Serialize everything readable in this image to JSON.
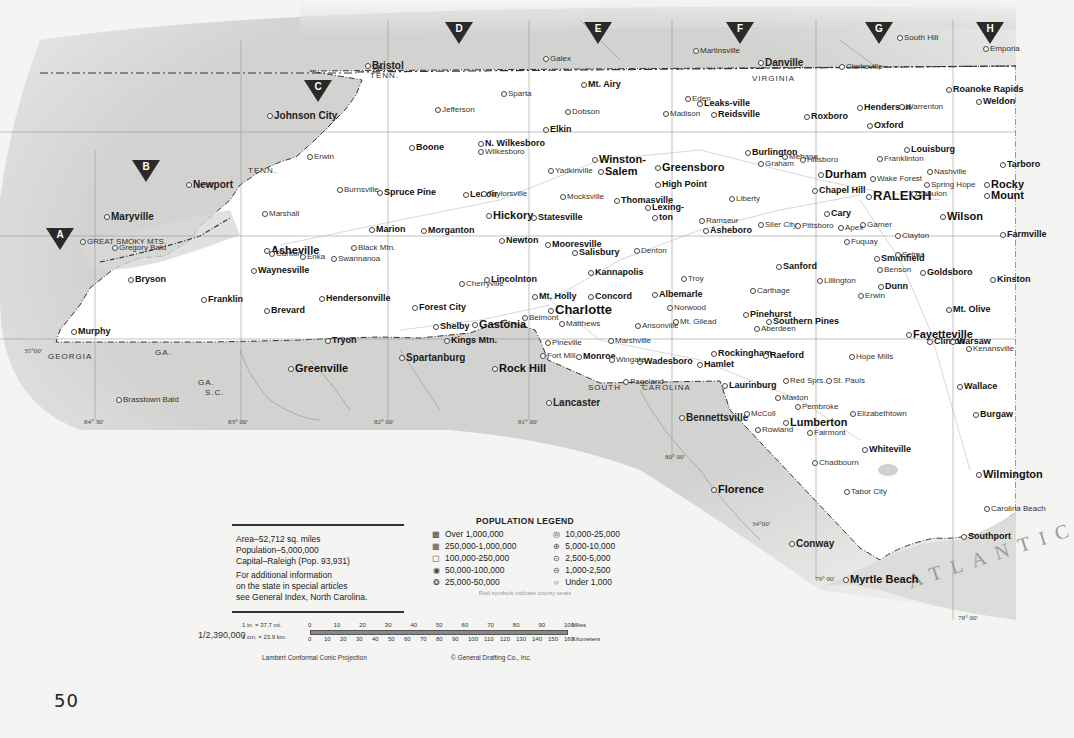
{
  "page": {
    "number": "50",
    "state_name": "North Carolina"
  },
  "grid_markers": [
    {
      "label": "A",
      "x": 60,
      "y": 228
    },
    {
      "label": "B",
      "x": 146,
      "y": 160
    },
    {
      "label": "C",
      "x": 318,
      "y": 80
    },
    {
      "label": "D",
      "x": 459,
      "y": 22
    },
    {
      "label": "E",
      "x": 598,
      "y": 22
    },
    {
      "label": "F",
      "x": 740,
      "y": 22
    },
    {
      "label": "G",
      "x": 879,
      "y": 22
    },
    {
      "label": "H",
      "x": 990,
      "y": 22
    }
  ],
  "info": {
    "area": "Area–52,712 sq. miles",
    "population": "Population–5,000,000",
    "capital": "Capital–Raleigh (Pop. 93,931)",
    "more_1": "For additional information",
    "more_2": "on the state in special articles",
    "more_3": "see General Index, North Carolina."
  },
  "legend": {
    "title": "POPULATION LEGEND",
    "left": [
      {
        "symbol": "▩",
        "label": "Over 1,000,000"
      },
      {
        "symbol": "▦",
        "label": "250,000-1,000,000"
      },
      {
        "symbol": "▢",
        "label": "100,000-250,000"
      },
      {
        "symbol": "◉",
        "label": "50,000-100,000"
      },
      {
        "symbol": "❂",
        "label": "25,000-50,000"
      }
    ],
    "right": [
      {
        "symbol": "◎",
        "label": "10,000-25,000"
      },
      {
        "symbol": "⊕",
        "label": "5,000-10,000"
      },
      {
        "symbol": "⊙",
        "label": "2,500-5,000"
      },
      {
        "symbol": "⊖",
        "label": "1,000-2,500"
      },
      {
        "symbol": "○",
        "label": "Under 1,000"
      }
    ],
    "note": "Red symbols indicate county seats"
  },
  "scale": {
    "ratio": "1/2,390,000",
    "inch_eq": "1 in.  =  37.7 mi.",
    "cm_eq": "1 cm.  =  23.9 km.",
    "miles_ticks": [
      "0",
      "10",
      "20",
      "30",
      "40",
      "50",
      "60",
      "70",
      "80",
      "90",
      "100"
    ],
    "miles_unit": "Miles",
    "km_ticks": [
      "0",
      "10",
      "20",
      "30",
      "40",
      "50",
      "60",
      "70",
      "80",
      "90",
      "100",
      "110",
      "120",
      "130",
      "140",
      "150",
      "160"
    ],
    "km_unit": "Kilometers",
    "projection": "Lambert Conformal Conic Projection",
    "copyright": "© General Drafting Co., Inc."
  },
  "labels": {
    "states": [
      {
        "text": "VIRGINIA",
        "x": 752,
        "y": 74
      },
      {
        "text": "VA.",
        "x": 372,
        "y": 63
      },
      {
        "text": "TENN.",
        "x": 370,
        "y": 71
      },
      {
        "text": "TENN.",
        "x": 248,
        "y": 166
      },
      {
        "text": "GEORGIA",
        "x": 48,
        "y": 352
      },
      {
        "text": "GA.",
        "x": 155,
        "y": 348
      },
      {
        "text": "GA.",
        "x": 198,
        "y": 378
      },
      {
        "text": "S.C.",
        "x": 205,
        "y": 388
      },
      {
        "text": "SOUTH",
        "x": 588,
        "y": 383
      },
      {
        "text": "CAROLINA",
        "x": 642,
        "y": 383
      }
    ],
    "coords": [
      {
        "text": "35°00'",
        "x": 24,
        "y": 347
      },
      {
        "text": "36°00'",
        "x": 196,
        "y": 181
      },
      {
        "text": "84° 30'",
        "x": 84,
        "y": 418
      },
      {
        "text": "83° 00'",
        "x": 228,
        "y": 418
      },
      {
        "text": "82° 00'",
        "x": 374,
        "y": 418
      },
      {
        "text": "81° 00'",
        "x": 518,
        "y": 418
      },
      {
        "text": "80° 00'",
        "x": 665,
        "y": 453
      },
      {
        "text": "34°00'",
        "x": 752,
        "y": 520
      },
      {
        "text": "79° 00'",
        "x": 815,
        "y": 575
      },
      {
        "text": "78° 00'",
        "x": 958,
        "y": 614
      }
    ],
    "ocean": "ATLANTIC"
  },
  "cities_external": [
    {
      "name": "Bristol",
      "x": 365,
      "y": 62,
      "cls": "extb"
    },
    {
      "name": "Johnson City",
      "x": 267,
      "y": 112,
      "cls": "extb"
    },
    {
      "name": "Galex",
      "x": 543,
      "y": 55,
      "cls": "ext"
    },
    {
      "name": "Martinsville",
      "x": 693,
      "y": 47,
      "cls": "ext"
    },
    {
      "name": "Danville",
      "x": 758,
      "y": 59,
      "cls": "extb"
    },
    {
      "name": "Clarksville",
      "x": 839,
      "y": 63,
      "cls": "ext"
    },
    {
      "name": "South Hill",
      "x": 897,
      "y": 34,
      "cls": "ext"
    },
    {
      "name": "Emporia",
      "x": 983,
      "y": 45,
      "cls": "ext"
    },
    {
      "name": "Newport",
      "x": 186,
      "y": 181,
      "cls": "extb"
    },
    {
      "name": "Maryville",
      "x": 104,
      "y": 213,
      "cls": "extb"
    },
    {
      "name": "Erwin",
      "x": 307,
      "y": 153,
      "cls": "ext"
    },
    {
      "name": "Greenville",
      "x": 288,
      "y": 364,
      "cls": "l"
    },
    {
      "name": "Spartanburg",
      "x": 399,
      "y": 354,
      "cls": "extb"
    },
    {
      "name": "Rock Hill",
      "x": 492,
      "y": 364,
      "cls": "l"
    },
    {
      "name": "Lancaster",
      "x": 546,
      "y": 399,
      "cls": "extb"
    },
    {
      "name": "Bennettsville",
      "x": 679,
      "y": 414,
      "cls": "extb"
    },
    {
      "name": "Florence",
      "x": 711,
      "y": 485,
      "cls": "l"
    },
    {
      "name": "Conway",
      "x": 789,
      "y": 540,
      "cls": "extb"
    },
    {
      "name": "Myrtle Beach",
      "x": 843,
      "y": 575,
      "cls": "l"
    },
    {
      "name": "Brasstown Bald",
      "x": 116,
      "y": 396,
      "cls": "ext"
    },
    {
      "name": "GREAT SMOKY MTS.",
      "x": 80,
      "y": 238,
      "cls": "ext"
    },
    {
      "name": "Gregory Bald",
      "x": 112,
      "y": 244,
      "cls": "ext"
    }
  ],
  "cities": [
    {
      "name": "Asheville",
      "x": 264,
      "y": 246,
      "cls": "l"
    },
    {
      "name": "Charlotte",
      "x": 548,
      "y": 306,
      "cls": "xl"
    },
    {
      "name": "Winston-",
      "x": 592,
      "y": 155,
      "cls": "l"
    },
    {
      "name": "Salem",
      "x": 598,
      "y": 167,
      "cls": "l"
    },
    {
      "name": "Greensboro",
      "x": 655,
      "y": 163,
      "cls": "l"
    },
    {
      "name": "High Point",
      "x": 655,
      "y": 180,
      "cls": "b"
    },
    {
      "name": "Durham",
      "x": 818,
      "y": 170,
      "cls": "l"
    },
    {
      "name": "RALEIGH",
      "x": 866,
      "y": 192,
      "cls": "xl"
    },
    {
      "name": "Chapel Hill",
      "x": 812,
      "y": 186,
      "cls": "b"
    },
    {
      "name": "Fayetteville",
      "x": 906,
      "y": 330,
      "cls": "l"
    },
    {
      "name": "Wilmington",
      "x": 976,
      "y": 470,
      "cls": "l"
    },
    {
      "name": "Rocky",
      "x": 984,
      "y": 180,
      "cls": "l"
    },
    {
      "name": "Mount",
      "x": 984,
      "y": 191,
      "cls": "l"
    },
    {
      "name": "Wilson",
      "x": 940,
      "y": 212,
      "cls": "l"
    },
    {
      "name": "Goldsboro",
      "x": 920,
      "y": 268,
      "cls": "b"
    },
    {
      "name": "Kinston",
      "x": 990,
      "y": 275,
      "cls": "b"
    },
    {
      "name": "Hickory",
      "x": 486,
      "y": 211,
      "cls": "l"
    },
    {
      "name": "Gastonia",
      "x": 472,
      "y": 320,
      "cls": "l"
    },
    {
      "name": "Concord",
      "x": 588,
      "y": 292,
      "cls": "b"
    },
    {
      "name": "Kannapolis",
      "x": 588,
      "y": 268,
      "cls": "b"
    },
    {
      "name": "Salisbury",
      "x": 572,
      "y": 248,
      "cls": "b"
    },
    {
      "name": "Statesville",
      "x": 531,
      "y": 213,
      "cls": "b"
    },
    {
      "name": "Lexing-",
      "x": 645,
      "y": 203,
      "cls": "b"
    },
    {
      "name": "ton",
      "x": 652,
      "y": 213,
      "cls": "b"
    },
    {
      "name": "Thomasville",
      "x": 614,
      "y": 196,
      "cls": "b"
    },
    {
      "name": "Burlington",
      "x": 745,
      "y": 148,
      "cls": "b"
    },
    {
      "name": "Reidsville",
      "x": 711,
      "y": 110,
      "cls": "b"
    },
    {
      "name": "Mt. Airy",
      "x": 581,
      "y": 80,
      "cls": "b"
    },
    {
      "name": "Lenoir",
      "x": 463,
      "y": 190,
      "cls": "b"
    },
    {
      "name": "Morganton",
      "x": 421,
      "y": 226,
      "cls": "b"
    },
    {
      "name": "Marion",
      "x": 369,
      "y": 225,
      "cls": "b"
    },
    {
      "name": "Shelby",
      "x": 433,
      "y": 322,
      "cls": "b"
    },
    {
      "name": "Monroe",
      "x": 576,
      "y": 352,
      "cls": "b"
    },
    {
      "name": "Albemarle",
      "x": 652,
      "y": 290,
      "cls": "b"
    },
    {
      "name": "Asheboro",
      "x": 703,
      "y": 226,
      "cls": "b"
    },
    {
      "name": "Sanford",
      "x": 776,
      "y": 262,
      "cls": "b"
    },
    {
      "name": "Lumberton",
      "x": 783,
      "y": 418,
      "cls": "l"
    },
    {
      "name": "Smithfield",
      "x": 874,
      "y": 254,
      "cls": "b"
    },
    {
      "name": "Henderson",
      "x": 857,
      "y": 103,
      "cls": "b"
    },
    {
      "name": "Oxford",
      "x": 867,
      "y": 121,
      "cls": "b"
    },
    {
      "name": "Roanoke Rapids",
      "x": 946,
      "y": 85,
      "cls": "b"
    },
    {
      "name": "Weldon",
      "x": 976,
      "y": 97,
      "cls": "b"
    },
    {
      "name": "Louisburg",
      "x": 904,
      "y": 145,
      "cls": "b"
    },
    {
      "name": "Clinton",
      "x": 927,
      "y": 337,
      "cls": "b"
    },
    {
      "name": "Warsaw",
      "x": 950,
      "y": 337,
      "cls": "b"
    },
    {
      "name": "Whiteville",
      "x": 862,
      "y": 445,
      "cls": "b"
    },
    {
      "name": "Southern Pines",
      "x": 766,
      "y": 317,
      "cls": "b"
    },
    {
      "name": "Pinehurst",
      "x": 743,
      "y": 310,
      "cls": "b"
    },
    {
      "name": "Rockingham",
      "x": 711,
      "y": 349,
      "cls": "b"
    },
    {
      "name": "Laurinburg",
      "x": 722,
      "y": 381,
      "cls": "b"
    },
    {
      "name": "Hamlet",
      "x": 697,
      "y": 360,
      "cls": "b"
    },
    {
      "name": "Wadesboro",
      "x": 637,
      "y": 357,
      "cls": "b"
    },
    {
      "name": "Boone",
      "x": 409,
      "y": 143,
      "cls": "b"
    },
    {
      "name": "N. Wilkesboro",
      "x": 478,
      "y": 139,
      "cls": "b"
    },
    {
      "name": "Elkin",
      "x": 543,
      "y": 125,
      "cls": "b"
    },
    {
      "name": "Waynesville",
      "x": 251,
      "y": 266,
      "cls": "b"
    },
    {
      "name": "Franklin",
      "x": 201,
      "y": 295,
      "cls": "b"
    },
    {
      "name": "Hendersonville",
      "x": 319,
      "y": 294,
      "cls": "b"
    },
    {
      "name": "Brevard",
      "x": 264,
      "y": 306,
      "cls": "b"
    },
    {
      "name": "Murphy",
      "x": 71,
      "y": 327,
      "cls": "b"
    },
    {
      "name": "Bryson",
      "x": 128,
      "y": 275,
      "cls": "b"
    },
    {
      "name": "Mt. Holly",
      "x": 532,
      "y": 292,
      "cls": "b"
    },
    {
      "name": "Forest City",
      "x": 412,
      "y": 303,
      "cls": "b"
    },
    {
      "name": "Kings Mtn.",
      "x": 444,
      "y": 336,
      "cls": "b"
    },
    {
      "name": "Tryon",
      "x": 325,
      "y": 336,
      "cls": "b"
    },
    {
      "name": "Newton",
      "x": 499,
      "y": 236,
      "cls": "b"
    },
    {
      "name": "Mooresville",
      "x": 545,
      "y": 240,
      "cls": "b"
    },
    {
      "name": "Spruce Pine",
      "x": 377,
      "y": 188,
      "cls": "b"
    },
    {
      "name": "Black Mtn.",
      "x": 351,
      "y": 244,
      "cls": "ext"
    },
    {
      "name": "Enka",
      "x": 300,
      "y": 253,
      "cls": "ext"
    },
    {
      "name": "Swannanoa",
      "x": 331,
      "y": 255,
      "cls": "ext"
    },
    {
      "name": "Canton",
      "x": 269,
      "y": 250,
      "cls": "ext"
    },
    {
      "name": "Marshall",
      "x": 262,
      "y": 210,
      "cls": "ext"
    },
    {
      "name": "Burnsville",
      "x": 337,
      "y": 186,
      "cls": "ext"
    },
    {
      "name": "Cary",
      "x": 824,
      "y": 209,
      "cls": "b"
    },
    {
      "name": "Garner",
      "x": 860,
      "y": 221,
      "cls": "ext"
    },
    {
      "name": "Apex",
      "x": 838,
      "y": 224,
      "cls": "ext"
    },
    {
      "name": "Clayton",
      "x": 895,
      "y": 232,
      "cls": "ext"
    },
    {
      "name": "Selma",
      "x": 895,
      "y": 251,
      "cls": "ext"
    },
    {
      "name": "Fuquay",
      "x": 844,
      "y": 238,
      "cls": "ext"
    },
    {
      "name": "Dunn",
      "x": 878,
      "y": 282,
      "cls": "b"
    },
    {
      "name": "Erwin",
      "x": 858,
      "y": 292,
      "cls": "ext"
    },
    {
      "name": "Nashville",
      "x": 927,
      "y": 168,
      "cls": "ext"
    },
    {
      "name": "Tarboro",
      "x": 1000,
      "y": 160,
      "cls": "b"
    },
    {
      "name": "Farmville",
      "x": 1000,
      "y": 230,
      "cls": "b"
    },
    {
      "name": "Mt. Olive",
      "x": 946,
      "y": 305,
      "cls": "b"
    },
    {
      "name": "Kenansville",
      "x": 966,
      "y": 345,
      "cls": "ext"
    },
    {
      "name": "Wallace",
      "x": 957,
      "y": 382,
      "cls": "b"
    },
    {
      "name": "Burgaw",
      "x": 973,
      "y": 410,
      "cls": "b"
    },
    {
      "name": "Elizabethtown",
      "x": 850,
      "y": 410,
      "cls": "ext"
    },
    {
      "name": "Fairmont",
      "x": 807,
      "y": 429,
      "cls": "ext"
    },
    {
      "name": "Chadbourn",
      "x": 812,
      "y": 459,
      "cls": "ext"
    },
    {
      "name": "Tabor City",
      "x": 844,
      "y": 488,
      "cls": "ext"
    },
    {
      "name": "Southport",
      "x": 961,
      "y": 532,
      "cls": "b"
    },
    {
      "name": "Carolina Beach",
      "x": 984,
      "y": 505,
      "cls": "ext"
    },
    {
      "name": "St. Pauls",
      "x": 826,
      "y": 377,
      "cls": "ext"
    },
    {
      "name": "Raeford",
      "x": 763,
      "y": 351,
      "cls": "b"
    },
    {
      "name": "Aberdeen",
      "x": 754,
      "y": 325,
      "cls": "ext"
    },
    {
      "name": "Carthage",
      "x": 750,
      "y": 287,
      "cls": "ext"
    },
    {
      "name": "Troy",
      "x": 681,
      "y": 275,
      "cls": "ext"
    },
    {
      "name": "Siler City",
      "x": 758,
      "y": 221,
      "cls": "ext"
    },
    {
      "name": "Pittsboro",
      "x": 795,
      "y": 222,
      "cls": "ext"
    },
    {
      "name": "Graham",
      "x": 758,
      "y": 160,
      "cls": "ext"
    },
    {
      "name": "Mebane",
      "x": 782,
      "y": 153,
      "cls": "ext"
    },
    {
      "name": "Hillsboro",
      "x": 800,
      "y": 156,
      "cls": "ext"
    },
    {
      "name": "Roxboro",
      "x": 804,
      "y": 112,
      "cls": "b"
    },
    {
      "name": "Warrenton",
      "x": 899,
      "y": 103,
      "cls": "ext"
    },
    {
      "name": "Eden",
      "x": 685,
      "y": 95,
      "cls": "ext"
    },
    {
      "name": "Madison",
      "x": 663,
      "y": 110,
      "cls": "ext"
    },
    {
      "name": "Leaks-ville",
      "x": 697,
      "y": 99,
      "cls": "b"
    },
    {
      "name": "Yadkinville",
      "x": 548,
      "y": 167,
      "cls": "ext"
    },
    {
      "name": "Mocksville",
      "x": 560,
      "y": 193,
      "cls": "ext"
    },
    {
      "name": "Taylorsville",
      "x": 481,
      "y": 190,
      "cls": "ext"
    },
    {
      "name": "Wilkesboro",
      "x": 478,
      "y": 148,
      "cls": "ext"
    },
    {
      "name": "Sparta",
      "x": 501,
      "y": 90,
      "cls": "ext"
    },
    {
      "name": "Jefferson",
      "x": 435,
      "y": 106,
      "cls": "ext"
    },
    {
      "name": "Dobson",
      "x": 565,
      "y": 108,
      "cls": "ext"
    },
    {
      "name": "Lincolnton",
      "x": 484,
      "y": 275,
      "cls": "b"
    },
    {
      "name": "Cherryville",
      "x": 459,
      "y": 280,
      "cls": "ext"
    },
    {
      "name": "Belmont",
      "x": 522,
      "y": 314,
      "cls": "ext"
    },
    {
      "name": "Matthews",
      "x": 559,
      "y": 320,
      "cls": "ext"
    },
    {
      "name": "Pineville",
      "x": 545,
      "y": 339,
      "cls": "ext"
    },
    {
      "name": "Fort Mill",
      "x": 540,
      "y": 352,
      "cls": "ext"
    },
    {
      "name": "Denton",
      "x": 634,
      "y": 247,
      "cls": "ext"
    },
    {
      "name": "Ramseur",
      "x": 699,
      "y": 217,
      "cls": "ext"
    },
    {
      "name": "Liberty",
      "x": 729,
      "y": 195,
      "cls": "ext"
    },
    {
      "name": "Zebulon",
      "x": 911,
      "y": 190,
      "cls": "ext"
    },
    {
      "name": "Wake Forest",
      "x": 870,
      "y": 175,
      "cls": "ext"
    },
    {
      "name": "Franklinton",
      "x": 877,
      "y": 155,
      "cls": "ext"
    },
    {
      "name": "Spring Hope",
      "x": 924,
      "y": 181,
      "cls": "ext"
    },
    {
      "name": "Benson",
      "x": 877,
      "y": 266,
      "cls": "ext"
    },
    {
      "name": "Lillington",
      "x": 817,
      "y": 277,
      "cls": "ext"
    },
    {
      "name": "Hope Mills",
      "x": 849,
      "y": 353,
      "cls": "ext"
    },
    {
      "name": "Red Sprs.",
      "x": 783,
      "y": 377,
      "cls": "ext"
    },
    {
      "name": "Maxton",
      "x": 775,
      "y": 394,
      "cls": "ext"
    },
    {
      "name": "Pembroke",
      "x": 795,
      "y": 403,
      "cls": "ext"
    },
    {
      "name": "Rowland",
      "x": 755,
      "y": 426,
      "cls": "ext"
    },
    {
      "name": "McColl",
      "x": 744,
      "y": 410,
      "cls": "ext"
    },
    {
      "name": "Pageland",
      "x": 623,
      "y": 378,
      "cls": "ext"
    },
    {
      "name": "Marshville",
      "x": 608,
      "y": 337,
      "cls": "ext"
    },
    {
      "name": "Wingate",
      "x": 609,
      "y": 356,
      "cls": "ext"
    },
    {
      "name": "Norwood",
      "x": 667,
      "y": 304,
      "cls": "ext"
    },
    {
      "name": "Mt. Gilead",
      "x": 673,
      "y": 318,
      "cls": "ext"
    },
    {
      "name": "Ansonville",
      "x": 635,
      "y": 322,
      "cls": "ext"
    }
  ]
}
